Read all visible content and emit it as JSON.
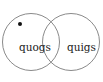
{
  "diagram": {
    "type": "venn",
    "sets": [
      {
        "label": "quogs",
        "cx": 31,
        "cy": 42,
        "r": 28.5,
        "label_x": 19,
        "label_y": 51
      },
      {
        "label": "quigs",
        "cx": 71,
        "cy": 42,
        "r": 28.5,
        "label_x": 67,
        "label_y": 51
      }
    ],
    "points": [
      {
        "x": 20,
        "y": 24,
        "region": "quogs only"
      }
    ],
    "colors": {
      "stroke": "#8a8a8a",
      "dot": "#111111",
      "text": "#222222"
    }
  }
}
